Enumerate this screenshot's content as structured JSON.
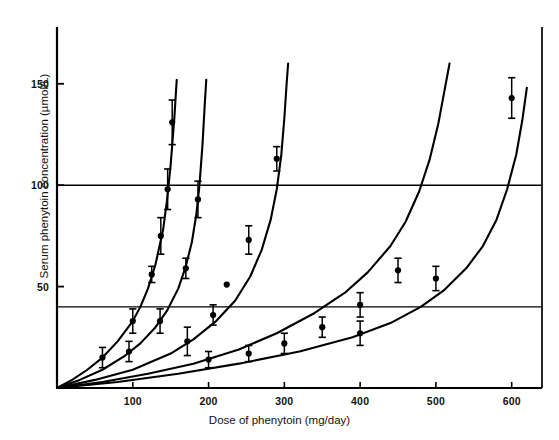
{
  "chart_data": {
    "type": "line",
    "title": "",
    "xlabel": "Dose of phenytoin (mg/day)",
    "ylabel": "Serum phenytoin concentration (µmol/L)",
    "xlim": [
      0,
      640
    ],
    "ylim": [
      0,
      178
    ],
    "xticks": [
      100,
      200,
      300,
      400,
      500,
      600
    ],
    "xtick_labels": [
      "100",
      "200",
      "300",
      "400",
      "500",
      "600"
    ],
    "yticks": [
      50,
      100,
      150
    ],
    "ytick_labels": [
      "50",
      "100",
      "150"
    ],
    "grid": false,
    "legend": "none",
    "reference_lines": [
      {
        "name": "lower-therapeutic-line",
        "y": 40,
        "label": ""
      },
      {
        "name": "upper-therapeutic-line",
        "y": 100,
        "label": ""
      }
    ],
    "series": [
      {
        "name": "patient-1",
        "curve": [
          [
            0,
            0
          ],
          [
            20,
            4
          ],
          [
            40,
            9
          ],
          [
            60,
            15
          ],
          [
            80,
            23
          ],
          [
            100,
            33
          ],
          [
            110,
            40
          ],
          [
            120,
            49
          ],
          [
            130,
            61
          ],
          [
            140,
            78
          ],
          [
            145,
            92
          ],
          [
            150,
            110
          ],
          [
            155,
            134
          ],
          [
            158,
            152
          ]
        ],
        "points": [
          {
            "x": 60,
            "y": 15,
            "err": 5
          },
          {
            "x": 100,
            "y": 33,
            "err": 6
          },
          {
            "x": 125,
            "y": 56,
            "err": 4
          },
          {
            "x": 137,
            "y": 75,
            "err": 9
          },
          {
            "x": 146,
            "y": 98,
            "err": 10
          },
          {
            "x": 152,
            "y": 131,
            "err": 11
          }
        ]
      },
      {
        "name": "patient-2",
        "curve": [
          [
            0,
            0
          ],
          [
            30,
            4
          ],
          [
            60,
            9
          ],
          [
            90,
            16
          ],
          [
            110,
            22
          ],
          [
            130,
            30
          ],
          [
            145,
            38
          ],
          [
            160,
            49
          ],
          [
            170,
            60
          ],
          [
            178,
            72
          ],
          [
            184,
            86
          ],
          [
            188,
            100
          ],
          [
            192,
            120
          ],
          [
            195,
            140
          ],
          [
            197,
            152
          ]
        ],
        "points": [
          {
            "x": 95,
            "y": 18,
            "err": 5
          },
          {
            "x": 136,
            "y": 33,
            "err": 6
          },
          {
            "x": 170,
            "y": 59,
            "err": 5
          },
          {
            "x": 186,
            "y": 93,
            "err": 9
          }
        ]
      },
      {
        "name": "patient-3",
        "curve": [
          [
            0,
            0
          ],
          [
            50,
            4
          ],
          [
            100,
            9
          ],
          [
            150,
            17
          ],
          [
            180,
            24
          ],
          [
            210,
            33
          ],
          [
            235,
            43
          ],
          [
            255,
            55
          ],
          [
            270,
            68
          ],
          [
            282,
            83
          ],
          [
            290,
            98
          ],
          [
            296,
            115
          ],
          [
            300,
            133
          ],
          [
            303,
            150
          ],
          [
            305,
            160
          ]
        ],
        "points": [
          {
            "x": 172,
            "y": 23,
            "err": 7
          },
          {
            "x": 206,
            "y": 36,
            "err": 5
          },
          {
            "x": 224,
            "y": 51,
            "err": 0
          },
          {
            "x": 253,
            "y": 73,
            "err": 7
          },
          {
            "x": 290,
            "y": 113,
            "err": 6
          }
        ]
      },
      {
        "name": "patient-4",
        "curve": [
          [
            0,
            0
          ],
          [
            60,
            3
          ],
          [
            120,
            7
          ],
          [
            180,
            12
          ],
          [
            240,
            19
          ],
          [
            290,
            27
          ],
          [
            340,
            37
          ],
          [
            380,
            47
          ],
          [
            410,
            57
          ],
          [
            440,
            70
          ],
          [
            460,
            82
          ],
          [
            478,
            97
          ],
          [
            492,
            113
          ],
          [
            503,
            130
          ],
          [
            512,
            148
          ],
          [
            518,
            160
          ]
        ],
        "points": [
          {
            "x": 200,
            "y": 14,
            "err": 4
          },
          {
            "x": 253,
            "y": 17,
            "err": 4
          },
          {
            "x": 300,
            "y": 22,
            "err": 5
          },
          {
            "x": 350,
            "y": 30,
            "err": 5
          },
          {
            "x": 400,
            "y": 41,
            "err": 6
          },
          {
            "x": 450,
            "y": 58,
            "err": 6
          }
        ]
      },
      {
        "name": "patient-5",
        "curve": [
          [
            0,
            0
          ],
          [
            80,
            3
          ],
          [
            160,
            7
          ],
          [
            240,
            12
          ],
          [
            320,
            18
          ],
          [
            390,
            25
          ],
          [
            440,
            32
          ],
          [
            480,
            40
          ],
          [
            510,
            48
          ],
          [
            540,
            59
          ],
          [
            562,
            70
          ],
          [
            580,
            83
          ],
          [
            594,
            98
          ],
          [
            606,
            115
          ],
          [
            614,
            132
          ],
          [
            620,
            148
          ]
        ],
        "points": [
          {
            "x": 400,
            "y": 27,
            "err": 6
          },
          {
            "x": 500,
            "y": 54,
            "err": 6
          },
          {
            "x": 600,
            "y": 143,
            "err": 10
          }
        ]
      }
    ]
  },
  "axes": {
    "x_title": "Dose of phenytoin (mg/day)",
    "y_title": "Serum phenytoin concentration (µmol/L)",
    "x_ticks": [
      "100",
      "200",
      "300",
      "400",
      "500",
      "600"
    ],
    "y_ticks": [
      "150",
      "100",
      "50"
    ]
  },
  "style": {
    "line_color": "#000000",
    "marker_color": "#000000",
    "background": "#ffffff"
  }
}
